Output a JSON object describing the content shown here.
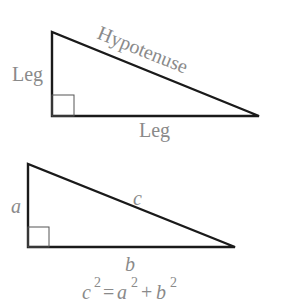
{
  "diagram": {
    "top_triangle": {
      "vertical_leg_label": "Leg",
      "horizontal_leg_label": "Leg",
      "hypotenuse_label": "Hypotenuse"
    },
    "bottom_triangle": {
      "side_a_label": "a",
      "side_b_label": "b",
      "side_c_label": "c"
    },
    "formula": {
      "c": "c",
      "eq": "=",
      "a": "a",
      "plus": "+",
      "b": "b",
      "exp": "2"
    },
    "colors": {
      "stroke": "#1a1a1a",
      "label": "#8a8a8a",
      "right_angle_box": "#555555"
    }
  }
}
